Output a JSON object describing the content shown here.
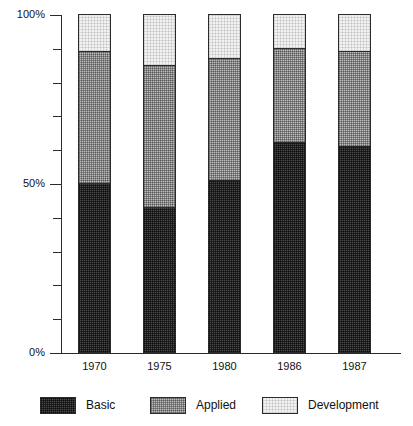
{
  "chart_data": {
    "type": "bar",
    "subtype": "stacked-100-percent",
    "title": "",
    "xlabel": "",
    "ylabel": "",
    "categories": [
      "1970",
      "1975",
      "1980",
      "1986",
      "1987"
    ],
    "series": [
      {
        "name": "Basic",
        "values": [
          50,
          43,
          51,
          62,
          61
        ]
      },
      {
        "name": "Applied",
        "values": [
          39,
          42,
          36,
          28,
          28
        ]
      },
      {
        "name": "Development",
        "values": [
          11,
          15,
          13,
          10,
          11
        ]
      }
    ],
    "cumulative_tops": [
      {
        "category": "1970",
        "basic_top": 50,
        "applied_top": 89,
        "development_top": 100
      },
      {
        "category": "1975",
        "basic_top": 43,
        "applied_top": 85,
        "development_top": 100
      },
      {
        "category": "1980",
        "basic_top": 51,
        "applied_top": 87,
        "development_top": 100
      },
      {
        "category": "1986",
        "basic_top": 62,
        "applied_top": 90,
        "development_top": 100
      },
      {
        "category": "1987",
        "basic_top": 61,
        "applied_top": 89,
        "development_top": 100
      }
    ],
    "ylim": [
      0,
      100
    ],
    "y_major_ticks": [
      {
        "value": 0,
        "label": "0%"
      },
      {
        "value": 50,
        "label": "50%"
      },
      {
        "value": 100,
        "label": "100%"
      }
    ],
    "y_minor_ticks": [
      10,
      20,
      30,
      40,
      60,
      70,
      80,
      90
    ],
    "grid": false,
    "legend_position": "bottom",
    "legend": [
      {
        "label": "Basic",
        "fill": "dark-dither",
        "color": "#4a4a4a"
      },
      {
        "label": "Applied",
        "fill": "medium-dither",
        "color": "#bdbdbd"
      },
      {
        "label": "Development",
        "fill": "light-dither",
        "color": "#f2f2f2"
      }
    ],
    "colors": {
      "basic": "#4a4a4a",
      "applied": "#bdbdbd",
      "development": "#f2f2f2",
      "axis": "#2b2b2b",
      "background": "#ffffff"
    }
  }
}
